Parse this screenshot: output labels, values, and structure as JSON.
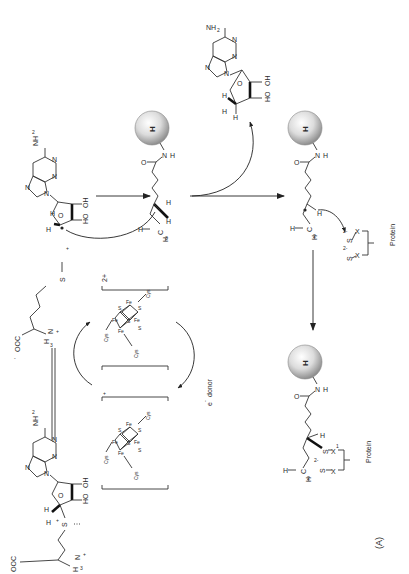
{
  "figure": {
    "panel_label": "(A)",
    "orientation": "rotated 90° counter-clockwise"
  },
  "colors": {
    "line": "#333333",
    "sphere_light": "#f4f4f4",
    "sphere_dark": "#9a9a9a",
    "background": "#ffffff"
  },
  "sam": {
    "nh2": "NH",
    "nh2_sub": "2",
    "n_labels": [
      "N",
      "N",
      "N",
      "N"
    ],
    "ring_o": "O",
    "oh1": "OH",
    "oh2": "HO",
    "h_label": "H",
    "h_label2": "H",
    "s_plus": "S",
    "plus": "+",
    "ooc": "OOC",
    "minus": "-",
    "h3n": "H",
    "h3n_sub": "3",
    "h3n_n": "N",
    "h3n_plus": "+"
  },
  "methionine": {
    "ooc": "OOC",
    "minus": "-",
    "h3n": "H",
    "h3n_sub": "3",
    "h3n_n": "N",
    "h3n_plus": "+",
    "s_minus": "S",
    "charge": "+"
  },
  "cluster_oxidized": {
    "charge": "2+",
    "cys": [
      "Cys",
      "Cys",
      "Cys"
    ],
    "fe": [
      "Fe",
      "Fe",
      "Fe",
      "Fe"
    ],
    "s": [
      "S",
      "S",
      "S",
      "S"
    ]
  },
  "cluster_reduced": {
    "charge": "+",
    "cys": [
      "Cys",
      "Cys",
      "Cys"
    ],
    "fe": [
      "Fe",
      "Fe",
      "Fe",
      "Fe"
    ],
    "s": [
      "S",
      "S",
      "S",
      "S"
    ]
  },
  "electron_donor": {
    "label": "e",
    "sup": "-",
    "text": "donor"
  },
  "deoxyadenosyl_radical": {
    "nh2": "NH",
    "nh2_sub": "2",
    "n_labels": [
      "N",
      "N",
      "N",
      "N"
    ],
    "ring_o": "O",
    "oh1": "OH",
    "oh2": "HO",
    "h1": "H",
    "h2": "H",
    "radical_c": "C"
  },
  "deoxyadenosine": {
    "nh2": "NH",
    "nh2_sub": "2",
    "n_labels": [
      "N",
      "N",
      "N",
      "N"
    ],
    "ring_o": "O",
    "oh1": "OH",
    "oh2": "HO",
    "h1": "H",
    "h2": "H",
    "h3": "H"
  },
  "dethiobiotin_1": {
    "sphere_label": "H",
    "o": "O",
    "n": "N",
    "nh_h": "H",
    "h_a": "H",
    "h_b": "H",
    "h3c_h": "H",
    "h3c": "H",
    "h3c_sub": "3",
    "h3c_c": "C"
  },
  "dethiobiotin_radical": {
    "sphere_label": "H",
    "o": "O",
    "n": "N",
    "nh_h": "H",
    "h_a": "H",
    "h3c_h": "H",
    "h3c": "H",
    "h3c_sub": "2",
    "h3c_c": "C",
    "s1": "S",
    "s1_charge": "2-",
    "s2": "S",
    "s2_charge": "2-",
    "x1": "X",
    "x2": "X",
    "protein": "Protein"
  },
  "product": {
    "sphere_label": "H",
    "o": "O",
    "n": "N",
    "nh_h": "H",
    "h_a": "H",
    "h_c": "H",
    "h2c": "H",
    "h2c_sub": "2",
    "h2c_c": "C",
    "s_bound": "S",
    "s_free": "S",
    "s_charge": "2-",
    "x1": "X",
    "x1_sup": "1",
    "x2": "X",
    "protein": "Protein"
  }
}
